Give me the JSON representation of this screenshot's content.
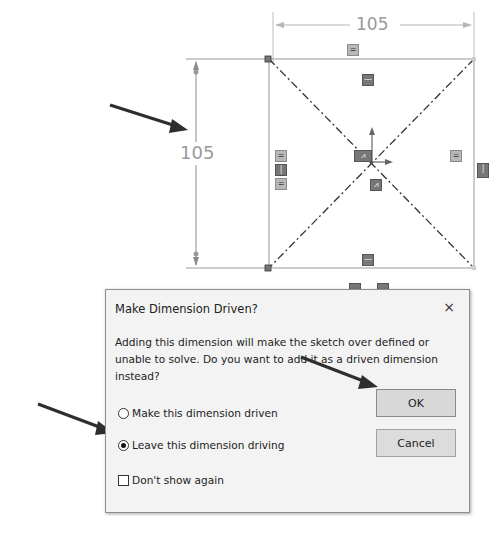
{
  "sketch": {
    "horizontal_dimension": "105",
    "vertical_dimension": "105",
    "relation_badges": {
      "equal": "=",
      "horizontal": "—",
      "vertical": "|",
      "midpoint": "⩘"
    }
  },
  "dialog": {
    "title": "Make Dimension Driven?",
    "close_label": "×",
    "message": "Adding this dimension will make the sketch over defined or unable to solve.  Do you want to add it as a driven dimension instead?",
    "options": [
      {
        "label": "Make this dimension driven",
        "selected": false
      },
      {
        "label": "Leave this dimension driving",
        "selected": true
      }
    ],
    "dont_show_again": {
      "label": "Don't show again",
      "checked": false
    },
    "buttons": {
      "ok": "OK",
      "cancel": "Cancel"
    }
  },
  "colors": {
    "sketch_line": "#8a8a8a",
    "dimension_text": "#9a9a9a",
    "dialog_bg": "#f3f3f3",
    "button_bg": "#dcdcdc",
    "arrow": "#2e2e2e"
  }
}
